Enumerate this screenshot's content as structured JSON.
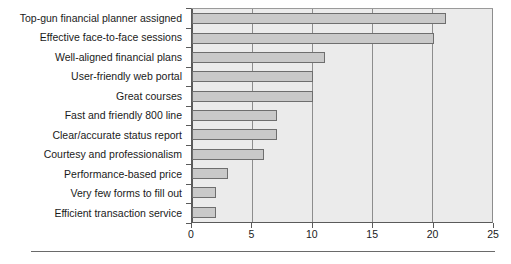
{
  "chart_data": {
    "type": "bar",
    "orientation": "horizontal",
    "title": "",
    "xlabel": "",
    "ylabel": "",
    "xlim": [
      0,
      25
    ],
    "xticks": [
      0,
      5,
      10,
      15,
      20,
      25
    ],
    "grid": true,
    "legend": false,
    "bar_color": "#c9c9c9",
    "bar_border_color": "#6e6e6e",
    "plot_background": "#ebebeb",
    "categories": [
      "Top-gun financial planner assigned",
      "Effective face-to-face sessions",
      "Well-aligned financial plans",
      "User-friendly web portal",
      "Great courses",
      "Fast and friendly 800 line",
      "Clear/accurate status report",
      "Courtesy and professionalism",
      "Performance-based price",
      "Very few forms to fill out",
      "Efficient transaction service"
    ],
    "values": [
      21,
      20,
      11,
      10,
      10,
      7,
      7,
      6,
      3,
      2,
      2
    ]
  }
}
